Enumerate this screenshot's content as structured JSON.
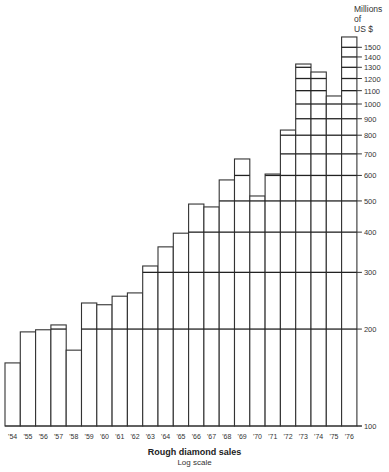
{
  "chart_data": {
    "type": "bar",
    "title": "Rough diamond sales",
    "subtitle": "Log scale",
    "ylabel": "Millions of US $",
    "xlabel": "",
    "yscale": "log",
    "ylim": [
      100,
      1600
    ],
    "categories": [
      "'54",
      "'55",
      "'56",
      "'57",
      "'58",
      "'59",
      "'60",
      "'61",
      "'62",
      "'63",
      "'64",
      "'65",
      "'66",
      "'67",
      "'68",
      "'69",
      "'70",
      "'71",
      "'72",
      "'73",
      "'74",
      "'75",
      "'76"
    ],
    "values": [
      157,
      196,
      199,
      206,
      172,
      241,
      238,
      253,
      259,
      314,
      360,
      397,
      489,
      479,
      581,
      675,
      518,
      606,
      830,
      1331,
      1257,
      1059,
      1615
    ],
    "yticks": [
      100,
      200,
      300,
      400,
      500,
      600,
      700,
      800,
      900,
      1000,
      1100,
      1200,
      1300,
      1400,
      1500
    ],
    "grid": "horizontal lines drawn only within bars at tick values",
    "legend": "none",
    "axis_position": "right"
  },
  "labels": {
    "unit_line1": "Millions",
    "unit_line2": "of",
    "unit_line3": "US $",
    "caption_title": "Rough diamond sales",
    "caption_sub": "Log scale"
  }
}
